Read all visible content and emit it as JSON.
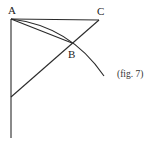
{
  "figure": {
    "caption": "(fig. 7)",
    "points": {
      "A": {
        "label": "A",
        "x": 11,
        "y": 19
      },
      "B": {
        "label": "B",
        "x": 72,
        "y": 43
      },
      "C": {
        "label": "C",
        "x": 99,
        "y": 20
      }
    },
    "lines": [
      {
        "name": "AC",
        "from": "A",
        "to": "C"
      },
      {
        "name": "vertical",
        "from": [
          11,
          19
        ],
        "to": [
          11,
          138
        ]
      },
      {
        "name": "diagonal",
        "from": [
          99,
          20
        ],
        "to": [
          11,
          97
        ]
      },
      {
        "name": "chord-AB",
        "from": "A",
        "to": "B"
      }
    ],
    "arc": {
      "from": "A",
      "through": "B",
      "to": [
        104,
        76
      ]
    },
    "colors": {
      "stroke": "#2a2a2a",
      "background": "#ffffff"
    }
  }
}
